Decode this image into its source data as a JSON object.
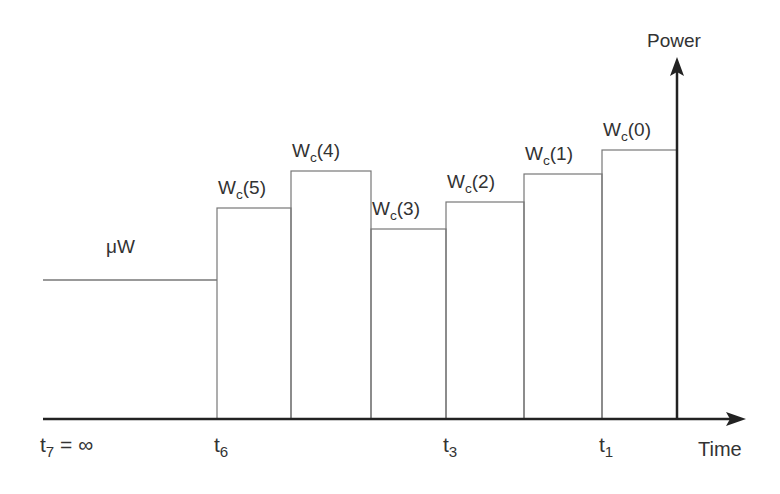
{
  "chart_data": {
    "type": "step",
    "title": "",
    "xlabel": "Time",
    "ylabel": "Power",
    "baseline_label": "μW",
    "x_tick_labels": [
      {
        "main": "t",
        "sub": "7",
        "suffix": " = ∞",
        "x": 43
      },
      {
        "main": "t",
        "sub": "6",
        "suffix": "",
        "x": 217
      },
      {
        "main": "t",
        "sub": "3",
        "suffix": "",
        "x": 446
      },
      {
        "main": "t",
        "sub": "1",
        "suffix": "",
        "x": 602
      }
    ],
    "segments": [
      {
        "label": "μW",
        "x0": 43,
        "x1": 217,
        "top": 280,
        "relative_height": 0.29
      },
      {
        "label_main": "W",
        "label_sub": "c",
        "label_arg": "(5)",
        "x0": 217,
        "x1": 291,
        "top": 208,
        "relative_height": 0.59
      },
      {
        "label_main": "W",
        "label_sub": "c",
        "label_arg": "(4)",
        "x0": 291,
        "x1": 371,
        "top": 171,
        "relative_height": 0.74
      },
      {
        "label_main": "W",
        "label_sub": "c",
        "label_arg": "(3)",
        "x0": 371,
        "x1": 446,
        "top": 229,
        "relative_height": 0.5
      },
      {
        "label_main": "W",
        "label_sub": "c",
        "label_arg": "(2)",
        "x0": 446,
        "x1": 524,
        "top": 202,
        "relative_height": 0.61
      },
      {
        "label_main": "W",
        "label_sub": "c",
        "label_arg": "(1)",
        "x0": 524,
        "x1": 602,
        "top": 174,
        "relative_height": 0.73
      },
      {
        "label_main": "W",
        "label_sub": "c",
        "label_arg": "(0)",
        "x0": 602,
        "x1": 677,
        "top": 150,
        "relative_height": 0.82
      }
    ],
    "axes": {
      "baseline_y": 419,
      "x_start": 43,
      "x_arrow_tip": 746,
      "y_axis_x": 677,
      "y_arrow_tip": 57
    },
    "grid": false,
    "legend": null
  },
  "colors": {
    "axis": "#222222",
    "bars": "#777777",
    "text": "#333333"
  }
}
